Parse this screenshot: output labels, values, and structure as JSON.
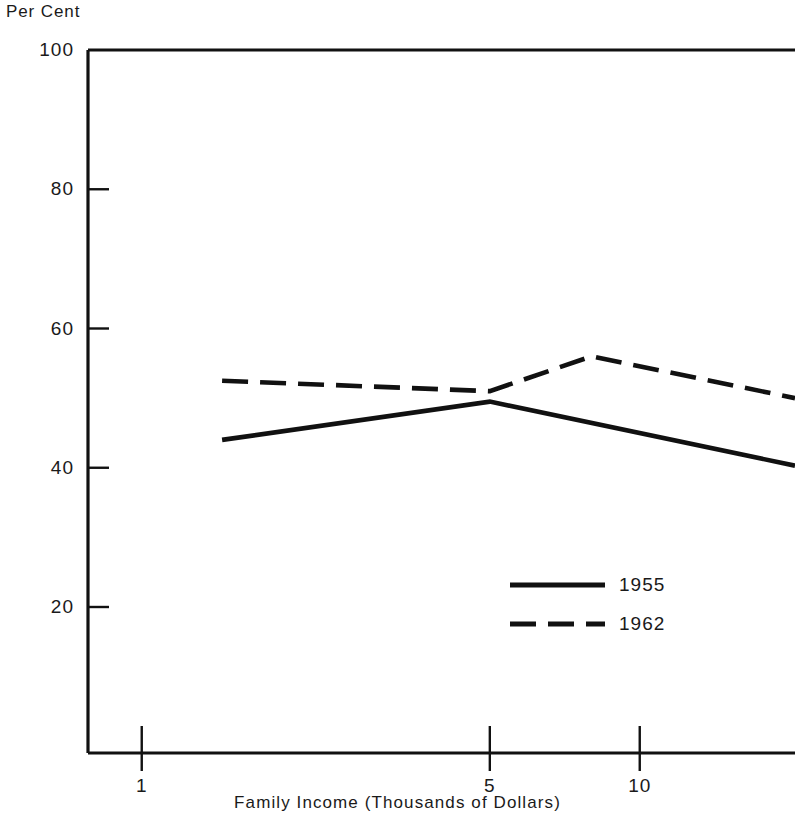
{
  "chart_data": {
    "type": "line",
    "title": "",
    "ylabel": "Per Cent",
    "xlabel": "Family Income (Thousands of Dollars)",
    "xscale": "log",
    "xlim": [
      0.78,
      20.5
    ],
    "ylim": [
      0,
      100
    ],
    "grid": false,
    "legend_position": "inside-lower-right",
    "x_tick_labels": [
      "1",
      "5",
      "10"
    ],
    "x_tick_values": [
      1,
      5,
      10
    ],
    "y_tick_labels": [
      "100",
      "80",
      "60",
      "40",
      "20"
    ],
    "y_tick_values": [
      100,
      80,
      60,
      40,
      20
    ],
    "series": [
      {
        "name": "1955",
        "style": "solid",
        "color": "#111111",
        "x": [
          1.45,
          5.0,
          20.5
        ],
        "y": [
          44.0,
          49.5,
          40.3
        ]
      },
      {
        "name": "1962",
        "style": "dashed",
        "color": "#111111",
        "x": [
          1.45,
          5.0,
          8.0,
          20.5
        ],
        "y": [
          52.5,
          51.0,
          56.0,
          50.0
        ]
      }
    ]
  },
  "legend": {
    "entries": [
      {
        "label": "1955",
        "style": "solid"
      },
      {
        "label": "1962",
        "style": "dashed"
      }
    ]
  },
  "axes": {
    "y_title": "Per Cent",
    "x_title": "Family Income (Thousands of Dollars)"
  }
}
